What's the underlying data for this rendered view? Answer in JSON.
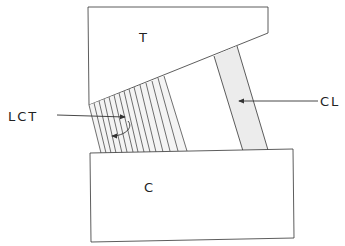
{
  "diagram": {
    "labels": {
      "top_block": "T",
      "bottom_block": "C",
      "hatched_region": "LCT",
      "band": "CL"
    },
    "colors": {
      "stroke": "#333333",
      "band_fill": "#ececec",
      "background": "#ffffff"
    }
  }
}
